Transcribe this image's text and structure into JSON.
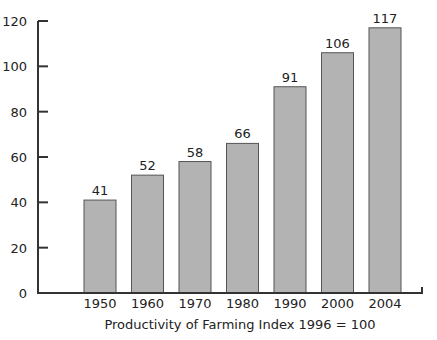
{
  "chart_data": {
    "type": "bar",
    "title": "",
    "xlabel": "Productivity of Farming Index 1996 = 100",
    "ylabel": "",
    "categories": [
      "1950",
      "1960",
      "1970",
      "1980",
      "1990",
      "2000",
      "2004"
    ],
    "values": [
      41,
      52,
      58,
      66,
      91,
      106,
      117
    ],
    "data_labels": [
      "41",
      "52",
      "58",
      "66",
      "91",
      "106",
      "117"
    ],
    "ylim": [
      0,
      120
    ],
    "yticks": [
      0,
      20,
      40,
      60,
      80,
      100,
      120
    ],
    "grid": false,
    "legend": null,
    "colors": {
      "bar_fill": "#b3b3b3",
      "bar_stroke": "#555555",
      "axis": "#333333"
    }
  }
}
